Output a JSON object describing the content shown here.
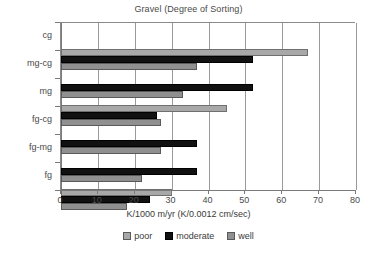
{
  "chart_data": {
    "type": "bar",
    "orientation": "horizontal",
    "title": "Gravel (Degree of Sorting)",
    "xlabel": "K/1000 m/yr (K/0.0012 cm/sec)",
    "ylabel": "",
    "xlim": [
      0,
      80
    ],
    "xticks": [
      0,
      10,
      20,
      30,
      40,
      50,
      60,
      70,
      80
    ],
    "xtick_labels": [
      "0",
      "10",
      "20",
      "30",
      "40",
      "50",
      "60",
      "70",
      "80"
    ],
    "grid": true,
    "grid_axis": "x",
    "legend_position": "bottom",
    "categories": [
      "cg",
      "mg-cg",
      "mg",
      "fg-cg",
      "fg-mg",
      "fg"
    ],
    "series": [
      {
        "name": "poor",
        "color": "#a8a8a8",
        "values": [
          67,
          0,
          45,
          0,
          0,
          30
        ]
      },
      {
        "name": "moderate",
        "color": "#111111",
        "values": [
          52,
          52,
          26,
          37,
          37,
          24
        ]
      },
      {
        "name": "well",
        "color": "#909090",
        "values": [
          37,
          33,
          27,
          27,
          22,
          18
        ]
      }
    ]
  },
  "legend": {
    "items": [
      {
        "label": "poor",
        "key": "poor"
      },
      {
        "label": "moderate",
        "key": "moderate"
      },
      {
        "label": "well",
        "key": "well"
      }
    ]
  }
}
